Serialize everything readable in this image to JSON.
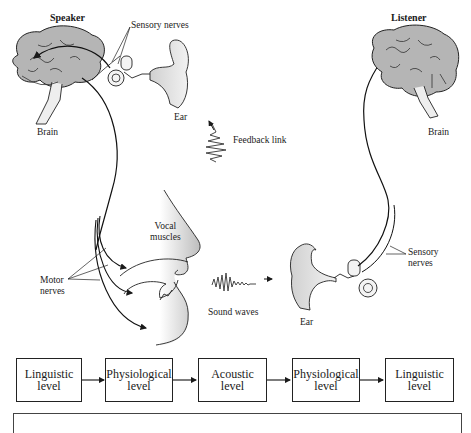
{
  "diagram": {
    "speaker": {
      "title": "Speaker",
      "brain_label": "Brain",
      "ear_label": "Ear",
      "sensory_nerves_label": "Sensory nerves",
      "vocal_muscles_label": [
        "Vocal",
        "muscles"
      ],
      "motor_nerves_label": [
        "Motor",
        "nerves"
      ]
    },
    "listener": {
      "title": "Listener",
      "brain_label": "Brain",
      "ear_label": "Ear",
      "sensory_nerves_label": [
        "Sensory",
        "nerves"
      ]
    },
    "feedback_label": "Feedback link",
    "sound_waves_label": "Sound waves",
    "levels": [
      {
        "line1": "Linguistic",
        "line2": "level"
      },
      {
        "line1": "Physiological",
        "line2": "level"
      },
      {
        "line1": "Acoustic",
        "line2": "level"
      },
      {
        "line1": "Physiological",
        "line2": "level"
      },
      {
        "line1": "Linguistic",
        "line2": "level"
      }
    ],
    "colors": {
      "brain_fill": "#b5b5b5",
      "line": "#1a1a1a",
      "face_gradient": "#c8c8c8"
    }
  }
}
